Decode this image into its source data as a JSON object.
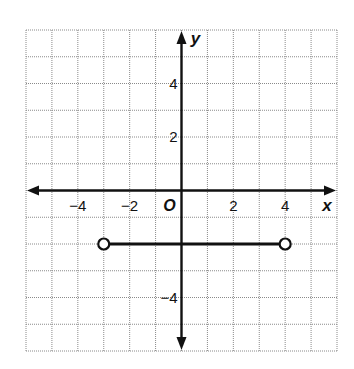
{
  "chart_data": {
    "type": "line",
    "title": "",
    "xlabel": "x",
    "ylabel": "y",
    "origin_label": "O",
    "xlim": [
      -6,
      6
    ],
    "ylim": [
      -6,
      6
    ],
    "grid": true,
    "x_tick_labels": [
      {
        "value": -4,
        "label": "−4"
      },
      {
        "value": -2,
        "label": "−2"
      },
      {
        "value": 2,
        "label": "2"
      },
      {
        "value": 4,
        "label": "4"
      }
    ],
    "y_tick_labels": [
      {
        "value": 4,
        "label": "4"
      },
      {
        "value": 2,
        "label": "2"
      },
      {
        "value": -4,
        "label": "−4"
      }
    ],
    "series": [
      {
        "name": "segment",
        "x": [
          -3,
          4
        ],
        "y": [
          -2,
          -2
        ],
        "endpoints": [
          {
            "x": -3,
            "y": -2,
            "style": "open"
          },
          {
            "x": 4,
            "y": -2,
            "style": "open"
          }
        ]
      }
    ],
    "legend": null
  }
}
